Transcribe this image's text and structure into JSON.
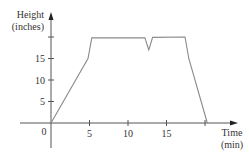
{
  "chart_data": {
    "type": "line",
    "title": "",
    "xlabel": "Time (min)",
    "ylabel": "Height (inches)",
    "xlabel_lines": [
      "Time",
      "(min)"
    ],
    "ylabel_lines": [
      "Height",
      "(inches)"
    ],
    "x_ticks": [
      5,
      10,
      15,
      20
    ],
    "x_tick_labels": [
      "5",
      "10",
      "15",
      ""
    ],
    "y_ticks": [
      5,
      10,
      15,
      20
    ],
    "y_tick_labels": [
      "5",
      "10",
      "15",
      ""
    ],
    "origin_label": "0",
    "xlim": [
      -2.5,
      23.5
    ],
    "ylim": [
      -6,
      24.5
    ],
    "grid": false,
    "legend": null,
    "series": [
      {
        "name": "Height",
        "x": [
          0,
          4.8,
          5.3,
          12.2,
          12.7,
          13.2,
          17.4,
          17.9,
          20.3
        ],
        "y": [
          0,
          15,
          19.8,
          19.8,
          17,
          19.9,
          20,
          15,
          0
        ]
      }
    ],
    "colors": {
      "line": "#8a8a8a",
      "axis": "#555555"
    }
  }
}
